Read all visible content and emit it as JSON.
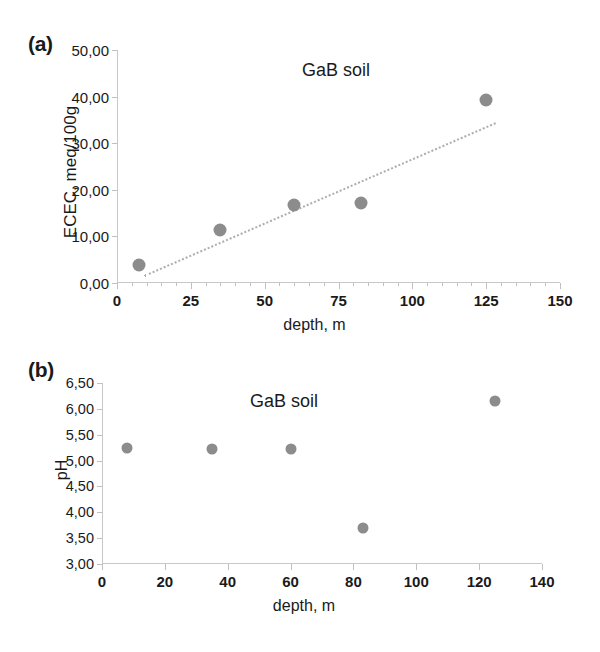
{
  "figure": {
    "marker_color": "#8c8c8c",
    "trendline_color": "#adadad",
    "axis_color": "#c8c8c8"
  },
  "panels": {
    "a": {
      "letter": "(a)",
      "annotation": "GaB soil",
      "xlabel": "depth, m",
      "ylabel": "ECEC, meq/100g",
      "y_ticks": [
        "50,00",
        "40,00",
        "30,00",
        "20,00",
        "10,00",
        "0,00"
      ],
      "x_ticks": [
        "0",
        "25",
        "50",
        "75",
        "100",
        "125",
        "150"
      ]
    },
    "b": {
      "letter": "(b)",
      "annotation": "GaB soil",
      "xlabel": "depth, m",
      "ylabel": "pH",
      "y_ticks": [
        "6,50",
        "6,00",
        "5,50",
        "5,00",
        "4,50",
        "4,00",
        "3,50",
        "3,00"
      ],
      "x_ticks": [
        "0",
        "20",
        "40",
        "60",
        "80",
        "100",
        "120",
        "140"
      ]
    }
  },
  "chart_data": [
    {
      "type": "scatter",
      "panel": "a",
      "title": "GaB soil",
      "xlabel": "depth, m",
      "ylabel": "ECEC, meq/100g",
      "xlim": [
        0,
        150
      ],
      "ylim": [
        0,
        50
      ],
      "xticks": [
        0,
        25,
        50,
        75,
        100,
        125,
        150
      ],
      "xminortick_step": 5,
      "yticks": [
        0,
        10,
        20,
        30,
        40,
        50
      ],
      "grid": false,
      "legend": "none",
      "series": [
        {
          "name": "GaB soil",
          "marker": "circle",
          "color": "#8c8c8c",
          "x": [
            7.5,
            35,
            60,
            82.5,
            125
          ],
          "y": [
            3.9,
            11.4,
            16.8,
            17.2,
            39.3
          ]
        }
      ],
      "trendline": {
        "style": "dotted",
        "color": "#adadad",
        "x": [
          9,
          128
        ],
        "y": [
          1.8,
          34.6
        ]
      }
    },
    {
      "type": "scatter",
      "panel": "b",
      "title": "GaB soil",
      "xlabel": "depth, m",
      "ylabel": "pH",
      "xlim": [
        0,
        140
      ],
      "ylim": [
        3.0,
        6.5
      ],
      "xticks": [
        0,
        20,
        40,
        60,
        80,
        100,
        120,
        140
      ],
      "yticks": [
        3.0,
        3.5,
        4.0,
        4.5,
        5.0,
        5.5,
        6.0,
        6.5
      ],
      "grid": false,
      "legend": "none",
      "series": [
        {
          "name": "GaB soil",
          "marker": "circle",
          "color": "#8c8c8c",
          "x": [
            8,
            35,
            60,
            83,
            125
          ],
          "y": [
            5.25,
            5.23,
            5.22,
            3.7,
            6.15
          ]
        }
      ]
    }
  ]
}
